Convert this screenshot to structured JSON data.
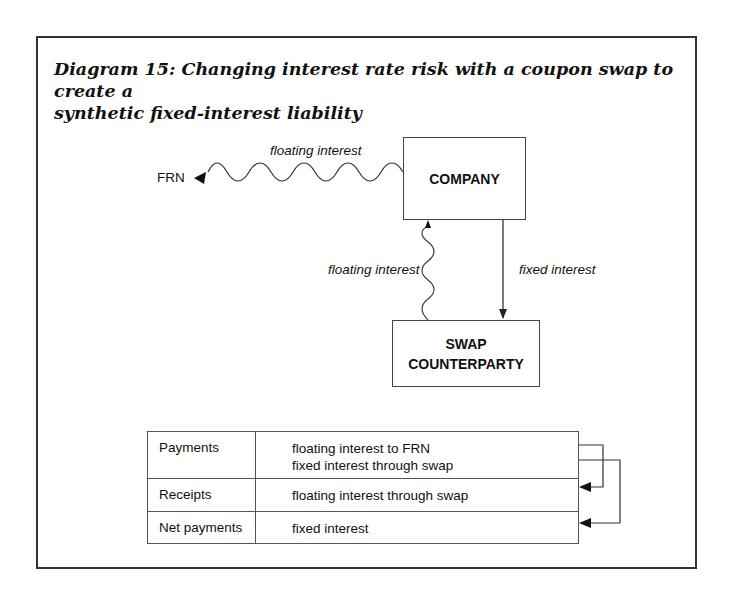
{
  "diagram": {
    "title_line1": "Diagram 15: Changing interest rate risk with a coupon swap to create a",
    "title_line2": "synthetic fixed-interest liability",
    "nodes": {
      "frn": "FRN",
      "company": "COMPANY",
      "swap_line1": "SWAP",
      "swap_line2": "COUNTERPARTY"
    },
    "edges": {
      "company_to_frn": "floating interest",
      "swap_to_company": "floating interest",
      "company_to_swap": "fixed interest"
    },
    "edge_styles": {
      "company_to_frn": "wavy",
      "swap_to_company": "wavy",
      "company_to_swap": "straight"
    },
    "colors": {
      "line": "#333333",
      "text": "#111111",
      "background": "#ffffff"
    }
  },
  "table": {
    "rows": [
      {
        "label": "Payments",
        "values": [
          "floating interest to FRN",
          "fixed interest through swap"
        ]
      },
      {
        "label": "Receipts",
        "values": [
          "floating interest through swap"
        ]
      },
      {
        "label": "Net payments",
        "values": [
          "fixed interest"
        ]
      }
    ],
    "connectors": [
      {
        "from": "Payments: floating interest to FRN",
        "to": "Receipts"
      },
      {
        "from": "Payments: fixed interest through swap",
        "to": "Net payments"
      }
    ]
  }
}
